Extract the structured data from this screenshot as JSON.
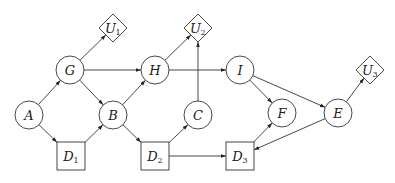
{
  "diagram": {
    "type": "influence-diagram",
    "colors": {
      "stroke": "#333333",
      "fill": "#ffffff",
      "text": "#222222"
    },
    "nodes": [
      {
        "id": "A",
        "label": "A",
        "sub": "",
        "shape": "circle",
        "x": 29,
        "y": 115
      },
      {
        "id": "G",
        "label": "G",
        "sub": "",
        "shape": "circle",
        "x": 70,
        "y": 70
      },
      {
        "id": "B",
        "label": "B",
        "sub": "",
        "shape": "circle",
        "x": 113,
        "y": 115
      },
      {
        "id": "H",
        "label": "H",
        "sub": "",
        "shape": "circle",
        "x": 155,
        "y": 70
      },
      {
        "id": "C",
        "label": "C",
        "sub": "",
        "shape": "circle",
        "x": 198,
        "y": 115
      },
      {
        "id": "I",
        "label": "I",
        "sub": "",
        "shape": "circle",
        "x": 240,
        "y": 70
      },
      {
        "id": "F",
        "label": "F",
        "sub": "",
        "shape": "circle",
        "x": 282,
        "y": 113
      },
      {
        "id": "E",
        "label": "E",
        "sub": "",
        "shape": "circle",
        "x": 338,
        "y": 113
      },
      {
        "id": "D1",
        "label": "D",
        "sub": "1",
        "shape": "square",
        "x": 71,
        "y": 156
      },
      {
        "id": "D2",
        "label": "D",
        "sub": "2",
        "shape": "square",
        "x": 155,
        "y": 156
      },
      {
        "id": "D3",
        "label": "D",
        "sub": "3",
        "shape": "square",
        "x": 240,
        "y": 156
      },
      {
        "id": "U1",
        "label": "U",
        "sub": "1",
        "shape": "diamond",
        "x": 113,
        "y": 28
      },
      {
        "id": "U2",
        "label": "U",
        "sub": "2",
        "shape": "diamond",
        "x": 198,
        "y": 28
      },
      {
        "id": "U3",
        "label": "U",
        "sub": "3",
        "shape": "diamond",
        "x": 370,
        "y": 70
      }
    ],
    "edges": [
      {
        "from": "A",
        "to": "G"
      },
      {
        "from": "A",
        "to": "D1"
      },
      {
        "from": "G",
        "to": "U1"
      },
      {
        "from": "G",
        "to": "H"
      },
      {
        "from": "G",
        "to": "B"
      },
      {
        "from": "D1",
        "to": "B"
      },
      {
        "from": "B",
        "to": "H"
      },
      {
        "from": "B",
        "to": "D2"
      },
      {
        "from": "H",
        "to": "U2"
      },
      {
        "from": "H",
        "to": "I"
      },
      {
        "from": "C",
        "to": "U2"
      },
      {
        "from": "D2",
        "to": "C"
      },
      {
        "from": "D2",
        "to": "D3"
      },
      {
        "from": "I",
        "to": "F"
      },
      {
        "from": "I",
        "to": "E"
      },
      {
        "from": "D3",
        "to": "F"
      },
      {
        "from": "E",
        "to": "D3"
      },
      {
        "from": "E",
        "to": "U3"
      }
    ]
  }
}
